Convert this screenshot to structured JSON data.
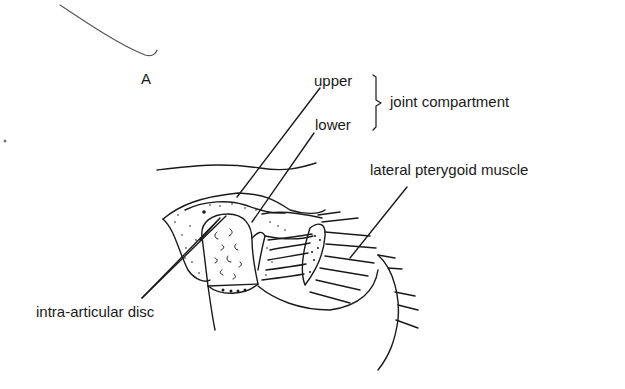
{
  "figure": {
    "panel_label": "A",
    "labels": {
      "upper": "upper",
      "lower": "lower",
      "compartment": "joint compartment",
      "muscle": "lateral pterygoid muscle",
      "disc": "intra-articular disc"
    },
    "style": {
      "ink_color": "#1a1a1a",
      "background": "#ffffff"
    }
  }
}
